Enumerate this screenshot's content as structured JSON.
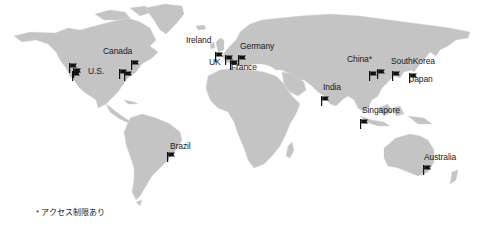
{
  "map": {
    "land_color": "#c4c4c4",
    "flag_color": "#111111",
    "labels": [
      {
        "id": "canada",
        "text": "Canada",
        "x": 103,
        "y": 47
      },
      {
        "id": "us",
        "text": "U.S.",
        "x": 88,
        "y": 67
      },
      {
        "id": "ireland",
        "text": "Ireland",
        "x": 186,
        "y": 36
      },
      {
        "id": "germany",
        "text": "Germany",
        "x": 240,
        "y": 42
      },
      {
        "id": "uk",
        "text": "UK",
        "x": 209,
        "y": 58
      },
      {
        "id": "france",
        "text": "France",
        "x": 231,
        "y": 63
      },
      {
        "id": "china",
        "text": "China*",
        "x": 347,
        "y": 55
      },
      {
        "id": "southkorea",
        "text": "SouthKorea",
        "x": 391,
        "y": 57
      },
      {
        "id": "japan",
        "text": "Japan",
        "x": 410,
        "y": 75
      },
      {
        "id": "india",
        "text": "India",
        "x": 323,
        "y": 83
      },
      {
        "id": "singapore",
        "text": "Singapore",
        "x": 362,
        "y": 106
      },
      {
        "id": "brazil",
        "text": "Brazil",
        "x": 170,
        "y": 142
      },
      {
        "id": "australia",
        "text": "Australia",
        "x": 424,
        "y": 153
      }
    ],
    "flags": [
      {
        "id": "us-west-1",
        "x": 69,
        "y": 59
      },
      {
        "id": "us-west-2",
        "x": 73,
        "y": 64
      },
      {
        "id": "us-west-3",
        "x": 72,
        "y": 67
      },
      {
        "id": "canada-east",
        "x": 131,
        "y": 56
      },
      {
        "id": "us-east-1",
        "x": 119,
        "y": 65
      },
      {
        "id": "us-east-2",
        "x": 124,
        "y": 67
      },
      {
        "id": "ireland",
        "x": 215,
        "y": 48
      },
      {
        "id": "uk",
        "x": 225,
        "y": 51
      },
      {
        "id": "france",
        "x": 230,
        "y": 56
      },
      {
        "id": "germany",
        "x": 238,
        "y": 51
      },
      {
        "id": "china-1",
        "x": 369,
        "y": 67
      },
      {
        "id": "china-2",
        "x": 377,
        "y": 65
      },
      {
        "id": "southkorea",
        "x": 392,
        "y": 67
      },
      {
        "id": "japan",
        "x": 409,
        "y": 69
      },
      {
        "id": "india",
        "x": 321,
        "y": 92
      },
      {
        "id": "singapore",
        "x": 360,
        "y": 115
      },
      {
        "id": "brazil",
        "x": 167,
        "y": 148
      },
      {
        "id": "australia",
        "x": 423,
        "y": 161
      }
    ]
  },
  "footnote": "* アクセス制限あり"
}
